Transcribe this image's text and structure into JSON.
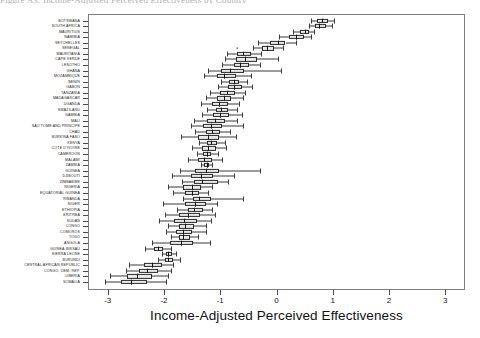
{
  "figure": {
    "title_clipped": "Figure A3. Income-Adjusted Perceived Effectiveness by Country",
    "page_background": "#ffffff",
    "frame_color": "#7d7d7d",
    "box_fill": "#e9e9e9",
    "line_color": "#2b2b2b"
  },
  "chart_data": {
    "type": "box",
    "title": "",
    "xlabel": "Income-Adjusted Perceived Effectiveness",
    "ylabel": "",
    "xlim": [
      -3.35,
      3.35
    ],
    "xticks": [
      -3,
      -2,
      -1,
      0,
      1,
      2,
      3
    ],
    "xticklabels": [
      "-3",
      "-2",
      "-1",
      "0",
      "1",
      "2",
      "3"
    ],
    "grid": false,
    "legend": null,
    "orientation": "horizontal",
    "categories": [
      "BOTSWANA",
      "SOUTH AFRICA",
      "MAURITIUS",
      "NAMIBIA",
      "SEYCHELLES",
      "SENEGAL",
      "MAURITANIA",
      "CAPE VERDE",
      "LESOTHO",
      "GHANA",
      "MOZAMBIQUE",
      "BENIN",
      "GABON",
      "TANZANIA",
      "MADAGASCAR",
      "UGANDA",
      "SWAZILAND",
      "GAMBIA",
      "MALI",
      "SÃO TOME AND PRINCIPE",
      "CHAD",
      "BURKINA FASO",
      "KENYA",
      "COTE D'IVOIRE",
      "CAMEROON",
      "MALAWI",
      "ZAMBIA",
      "GUINEA",
      "DJIBOUTI",
      "ZIMBABWE",
      "NIGERIA",
      "EQUATORIAL GUINEA",
      "RWANDA",
      "NIGER",
      "ETHIOPIA",
      "ERITREA",
      "SUDAN",
      "CONGO",
      "COMOROS",
      "TOGO",
      "ANGOLA",
      "GUINEA-BISSAU",
      "SIERRA LEONE",
      "BURUNDI",
      "CENTRAL AFRICAN REPUBLIC",
      "CONGO, DEM. REP.",
      "LIBERIA",
      "SOMALIA"
    ],
    "boxes": [
      {
        "category": "BOTSWANA",
        "whisker_low": 0.62,
        "q1": 0.72,
        "median": 0.8,
        "q3": 0.92,
        "whisker_high": 1.02,
        "outliers": []
      },
      {
        "category": "SOUTH AFRICA",
        "whisker_low": 0.58,
        "q1": 0.68,
        "median": 0.76,
        "q3": 0.88,
        "whisker_high": 0.98,
        "outliers": []
      },
      {
        "category": "MAURITIUS",
        "whisker_low": 0.3,
        "q1": 0.42,
        "median": 0.5,
        "q3": 0.58,
        "whisker_high": 0.66,
        "outliers": []
      },
      {
        "category": "NAMIBIA",
        "whisker_low": 0.05,
        "q1": 0.22,
        "median": 0.34,
        "q3": 0.48,
        "whisker_high": 0.62,
        "outliers": []
      },
      {
        "category": "SEYCHELLES",
        "whisker_low": -0.32,
        "q1": -0.12,
        "median": 0.02,
        "q3": 0.16,
        "whisker_high": 0.34,
        "outliers": []
      },
      {
        "category": "SENEGAL",
        "whisker_low": -0.42,
        "q1": -0.26,
        "median": -0.16,
        "q3": -0.04,
        "whisker_high": 0.12,
        "outliers": [
          -0.7
        ]
      },
      {
        "category": "MAURITANIA",
        "whisker_low": -0.88,
        "q1": -0.7,
        "median": -0.6,
        "q3": -0.46,
        "whisker_high": -0.28,
        "outliers": []
      },
      {
        "category": "CAPE VERDE",
        "whisker_low": -0.92,
        "q1": -0.72,
        "median": -0.56,
        "q3": -0.34,
        "whisker_high": 0.02,
        "outliers": []
      },
      {
        "category": "LESOTHO",
        "whisker_low": -0.96,
        "q1": -0.76,
        "median": -0.64,
        "q3": -0.48,
        "whisker_high": -0.3,
        "outliers": []
      },
      {
        "category": "GHANA",
        "whisker_low": -1.22,
        "q1": -0.98,
        "median": -0.82,
        "q3": -0.58,
        "whisker_high": 0.08,
        "outliers": []
      },
      {
        "category": "MOZAMBIQUE",
        "whisker_low": -1.28,
        "q1": -1.06,
        "median": -0.94,
        "q3": -0.72,
        "whisker_high": -0.46,
        "outliers": []
      },
      {
        "category": "BENIN",
        "whisker_low": -0.98,
        "q1": -0.84,
        "median": -0.76,
        "q3": -0.66,
        "whisker_high": -0.52,
        "outliers": []
      },
      {
        "category": "GABON",
        "whisker_low": -1.04,
        "q1": -0.86,
        "median": -0.76,
        "q3": -0.62,
        "whisker_high": -0.44,
        "outliers": []
      },
      {
        "category": "TANZANIA",
        "whisker_low": -1.18,
        "q1": -1.0,
        "median": -0.88,
        "q3": -0.74,
        "whisker_high": -0.56,
        "outliers": []
      },
      {
        "category": "MADAGASCAR",
        "whisker_low": -1.26,
        "q1": -1.06,
        "median": -0.94,
        "q3": -0.8,
        "whisker_high": -0.6,
        "outliers": []
      },
      {
        "category": "UGANDA",
        "whisker_low": -1.34,
        "q1": -1.14,
        "median": -1.02,
        "q3": -0.86,
        "whisker_high": -0.66,
        "outliers": []
      },
      {
        "category": "SWAZILAND",
        "whisker_low": -1.24,
        "q1": -1.08,
        "median": -0.98,
        "q3": -0.86,
        "whisker_high": -0.7,
        "outliers": []
      },
      {
        "category": "GAMBIA",
        "whisker_low": -1.32,
        "q1": -1.12,
        "median": -1.0,
        "q3": -0.84,
        "whisker_high": -0.62,
        "outliers": []
      },
      {
        "category": "MALI",
        "whisker_low": -1.46,
        "q1": -1.24,
        "median": -1.1,
        "q3": -0.92,
        "whisker_high": -0.7,
        "outliers": []
      },
      {
        "category": "SÃO TOME AND PRINCIPE",
        "whisker_low": -1.52,
        "q1": -1.3,
        "median": -1.16,
        "q3": -0.96,
        "whisker_high": -0.6,
        "outliers": []
      },
      {
        "category": "CHAD",
        "whisker_low": -1.44,
        "q1": -1.26,
        "median": -1.14,
        "q3": -1.0,
        "whisker_high": -0.82,
        "outliers": []
      },
      {
        "category": "BURKINA FASO",
        "whisker_low": -1.7,
        "q1": -1.4,
        "median": -1.22,
        "q3": -1.02,
        "whisker_high": -0.72,
        "outliers": []
      },
      {
        "category": "KENYA",
        "whisker_low": -1.38,
        "q1": -1.24,
        "median": -1.16,
        "q3": -1.06,
        "whisker_high": -0.92,
        "outliers": []
      },
      {
        "category": "COTE D'IVOIRE",
        "whisker_low": -1.5,
        "q1": -1.32,
        "median": -1.22,
        "q3": -1.08,
        "whisker_high": -0.9,
        "outliers": []
      },
      {
        "category": "CAMEROON",
        "whisker_low": -1.42,
        "q1": -1.3,
        "median": -1.24,
        "q3": -1.16,
        "whisker_high": -1.04,
        "outliers": []
      },
      {
        "category": "MALAWI",
        "whisker_low": -1.58,
        "q1": -1.4,
        "median": -1.28,
        "q3": -1.14,
        "whisker_high": -0.96,
        "outliers": []
      },
      {
        "category": "ZAMBIA",
        "whisker_low": -1.34,
        "q1": -1.28,
        "median": -1.24,
        "q3": -1.2,
        "whisker_high": -1.14,
        "outliers": []
      },
      {
        "category": "GUINEA",
        "whisker_low": -1.72,
        "q1": -1.44,
        "median": -1.26,
        "q3": -1.02,
        "whisker_high": -0.3,
        "outliers": []
      },
      {
        "category": "DJIBOUTI",
        "whisker_low": -1.86,
        "q1": -1.52,
        "median": -1.34,
        "q3": -1.12,
        "whisker_high": -0.76,
        "outliers": []
      },
      {
        "category": "ZIMBABWE",
        "whisker_low": -1.68,
        "q1": -1.46,
        "median": -1.32,
        "q3": -1.04,
        "whisker_high": -0.86,
        "outliers": []
      },
      {
        "category": "NIGERIA",
        "whisker_low": -1.92,
        "q1": -1.66,
        "median": -1.5,
        "q3": -1.34,
        "whisker_high": -1.14,
        "outliers": []
      },
      {
        "category": "EQUATORIAL GUINEA",
        "whisker_low": -1.84,
        "q1": -1.62,
        "median": -1.5,
        "q3": -1.38,
        "whisker_high": -1.22,
        "outliers": []
      },
      {
        "category": "RWANDA",
        "whisker_low": -1.66,
        "q1": -1.48,
        "median": -1.38,
        "q3": -1.16,
        "whisker_high": -0.6,
        "outliers": []
      },
      {
        "category": "NIGER",
        "whisker_low": -2.02,
        "q1": -1.62,
        "median": -1.44,
        "q3": -1.26,
        "whisker_high": -1.06,
        "outliers": []
      },
      {
        "category": "ETHIOPIA",
        "whisker_low": -1.76,
        "q1": -1.58,
        "median": -1.46,
        "q3": -1.3,
        "whisker_high": -1.14,
        "outliers": []
      },
      {
        "category": "ERITREA",
        "whisker_low": -1.98,
        "q1": -1.74,
        "median": -1.58,
        "q3": -1.36,
        "whisker_high": -1.1,
        "outliers": []
      },
      {
        "category": "SUDAN",
        "whisker_low": -2.08,
        "q1": -1.82,
        "median": -1.64,
        "q3": -1.42,
        "whisker_high": -1.16,
        "outliers": []
      },
      {
        "category": "CONGO",
        "whisker_low": -1.92,
        "q1": -1.74,
        "median": -1.62,
        "q3": -1.46,
        "whisker_high": -1.26,
        "outliers": []
      },
      {
        "category": "COMOROS",
        "whisker_low": -1.96,
        "q1": -1.78,
        "median": -1.66,
        "q3": -1.5,
        "whisker_high": -1.26,
        "outliers": []
      },
      {
        "category": "TOGO",
        "whisker_low": -1.88,
        "q1": -1.74,
        "median": -1.66,
        "q3": -1.54,
        "whisker_high": -1.4,
        "outliers": []
      },
      {
        "category": "ANGOLA",
        "whisker_low": -2.22,
        "q1": -1.9,
        "median": -1.7,
        "q3": -1.48,
        "whisker_high": -1.18,
        "outliers": []
      },
      {
        "category": "GUINEA-BISSAU",
        "whisker_low": -2.34,
        "q1": -2.18,
        "median": -2.1,
        "q3": -2.02,
        "whisker_high": -1.88,
        "outliers": []
      },
      {
        "category": "SIERRA LEONE",
        "whisker_low": -2.04,
        "q1": -1.96,
        "median": -1.92,
        "q3": -1.86,
        "whisker_high": -1.78,
        "outliers": []
      },
      {
        "category": "BURUNDI",
        "whisker_low": -2.1,
        "q1": -1.98,
        "median": -1.92,
        "q3": -1.84,
        "whisker_high": -1.72,
        "outliers": []
      },
      {
        "category": "CENTRAL AFRICAN REPUBLIC",
        "whisker_low": -2.62,
        "q1": -2.36,
        "median": -2.22,
        "q3": -2.04,
        "whisker_high": -1.84,
        "outliers": []
      },
      {
        "category": "CONGO, DEM. REP.",
        "whisker_low": -2.68,
        "q1": -2.44,
        "median": -2.3,
        "q3": -2.1,
        "whisker_high": -1.88,
        "outliers": []
      },
      {
        "category": "LIBERIA",
        "whisker_low": -2.96,
        "q1": -2.66,
        "median": -2.48,
        "q3": -2.22,
        "whisker_high": -1.92,
        "outliers": []
      },
      {
        "category": "SOMALIA",
        "whisker_low": -3.04,
        "q1": -2.76,
        "median": -2.58,
        "q3": -2.3,
        "whisker_high": -1.96,
        "outliers": []
      }
    ]
  }
}
